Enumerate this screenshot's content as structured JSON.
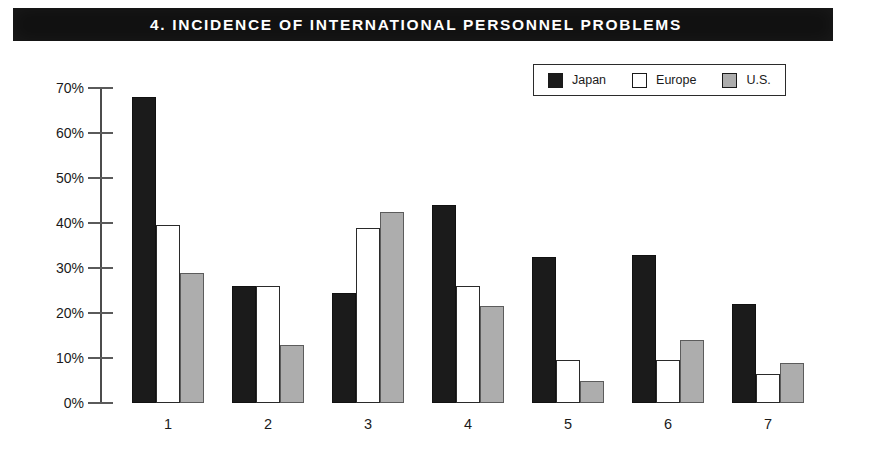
{
  "title": "4. INCIDENCE OF INTERNATIONAL PERSONNEL PROBLEMS",
  "colors": {
    "japan": "#1b1b1b",
    "europe": "#ffffff",
    "us": "#adadad",
    "banner": "#111111",
    "banner_text": "#ffffff",
    "axis": "#4c4c4c"
  },
  "legend": {
    "entries": [
      {
        "label": "Japan",
        "swatch": "japan-swatch-icon",
        "color": "#1b1b1b"
      },
      {
        "label": "Europe",
        "swatch": "europe-swatch-icon",
        "color": "#ffffff"
      },
      {
        "label": "U.S.",
        "swatch": "us-swatch-icon",
        "color": "#adadad"
      }
    ]
  },
  "chart_data": {
    "type": "bar",
    "title": "4. INCIDENCE OF INTERNATIONAL PERSONNEL PROBLEMS",
    "xlabel": "",
    "ylabel": "",
    "categories": [
      "1",
      "2",
      "3",
      "4",
      "5",
      "6",
      "7"
    ],
    "ytick_labels": [
      "70%",
      "60%",
      "50%",
      "40%",
      "30%",
      "20%",
      "10%",
      "0%"
    ],
    "ytick_values": [
      70,
      60,
      50,
      40,
      30,
      20,
      10,
      0
    ],
    "ylim": [
      0,
      70
    ],
    "grid": false,
    "legend_position": "top-right",
    "series": [
      {
        "name": "Japan",
        "values": [
          68,
          26,
          24.5,
          44,
          32.5,
          33,
          22
        ]
      },
      {
        "name": "Europe",
        "values": [
          39.5,
          26,
          39,
          26,
          9.5,
          9.5,
          6.5
        ]
      },
      {
        "name": "U.S.",
        "values": [
          29,
          13,
          42.5,
          21.5,
          5,
          14,
          9
        ]
      }
    ]
  }
}
